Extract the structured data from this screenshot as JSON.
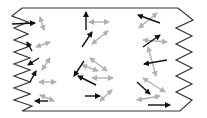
{
  "diagram": {
    "colors": {
      "outline": "#333333",
      "black_arrow": "#111111",
      "gray_arrow": "#b0b0b0",
      "background": "#ffffff"
    },
    "outline_points": "22,8 178,8 193,20 176,28 192,36 176,44 192,52 176,60 192,68 176,76 192,84 176,92 192,100 180,111 22,111 32,106 14,100 30,94 14,88 30,82 14,76 30,70 14,64 30,58 14,52 30,46 14,40 28,34 14,28 28,22 12,16",
    "black_arrows": [
      {
        "x1": 12,
        "y1": 24,
        "x2": 35,
        "y2": 23
      },
      {
        "x1": 32,
        "y1": 51,
        "x2": 27,
        "y2": 42
      },
      {
        "x1": 39,
        "y1": 58,
        "x2": 28,
        "y2": 65
      },
      {
        "x1": 30,
        "y1": 82,
        "x2": 36,
        "y2": 71
      },
      {
        "x1": 48,
        "y1": 101,
        "x2": 35,
        "y2": 101
      },
      {
        "x1": 86,
        "y1": 30,
        "x2": 86,
        "y2": 12
      },
      {
        "x1": 82,
        "y1": 47,
        "x2": 92,
        "y2": 32
      },
      {
        "x1": 84,
        "y1": 61,
        "x2": 74,
        "y2": 76
      },
      {
        "x1": 96,
        "y1": 85,
        "x2": 78,
        "y2": 76
      },
      {
        "x1": 85,
        "y1": 96,
        "x2": 100,
        "y2": 96
      },
      {
        "x1": 160,
        "y1": 23,
        "x2": 138,
        "y2": 15
      },
      {
        "x1": 143,
        "y1": 47,
        "x2": 160,
        "y2": 35
      },
      {
        "x1": 167,
        "y1": 60,
        "x2": 144,
        "y2": 64
      },
      {
        "x1": 137,
        "y1": 82,
        "x2": 150,
        "y2": 94
      },
      {
        "x1": 148,
        "y1": 105,
        "x2": 170,
        "y2": 105
      }
    ],
    "gray_arrows": [
      {
        "x1": 40,
        "y1": 17,
        "x2": 44,
        "y2": 30
      },
      {
        "x1": 36,
        "y1": 47,
        "x2": 50,
        "y2": 42
      },
      {
        "x1": 42,
        "y1": 70,
        "x2": 50,
        "y2": 58
      },
      {
        "x1": 39,
        "y1": 82,
        "x2": 56,
        "y2": 82
      },
      {
        "x1": 40,
        "y1": 95,
        "x2": 54,
        "y2": 101
      },
      {
        "x1": 89,
        "y1": 22,
        "x2": 109,
        "y2": 22
      },
      {
        "x1": 92,
        "y1": 44,
        "x2": 108,
        "y2": 31
      },
      {
        "x1": 90,
        "y1": 58,
        "x2": 107,
        "y2": 71
      },
      {
        "x1": 82,
        "y1": 65,
        "x2": 98,
        "y2": 71
      },
      {
        "x1": 92,
        "y1": 78,
        "x2": 113,
        "y2": 78
      },
      {
        "x1": 100,
        "y1": 101,
        "x2": 112,
        "y2": 90
      },
      {
        "x1": 139,
        "y1": 28,
        "x2": 157,
        "y2": 13
      },
      {
        "x1": 143,
        "y1": 40,
        "x2": 167,
        "y2": 42
      },
      {
        "x1": 148,
        "y1": 47,
        "x2": 156,
        "y2": 76
      },
      {
        "x1": 143,
        "y1": 78,
        "x2": 165,
        "y2": 92
      },
      {
        "x1": 137,
        "y1": 100,
        "x2": 160,
        "y2": 96
      }
    ]
  }
}
